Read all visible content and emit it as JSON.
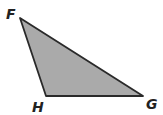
{
  "diagram": {
    "shape": "triangle",
    "fill_color": "#aaaaaa",
    "stroke_color": "#2a2a2a",
    "vertices": [
      {
        "label": "F",
        "x": 20,
        "y": 18
      },
      {
        "label": "H",
        "x": 46,
        "y": 96
      },
      {
        "label": "G",
        "x": 143,
        "y": 96
      }
    ]
  }
}
